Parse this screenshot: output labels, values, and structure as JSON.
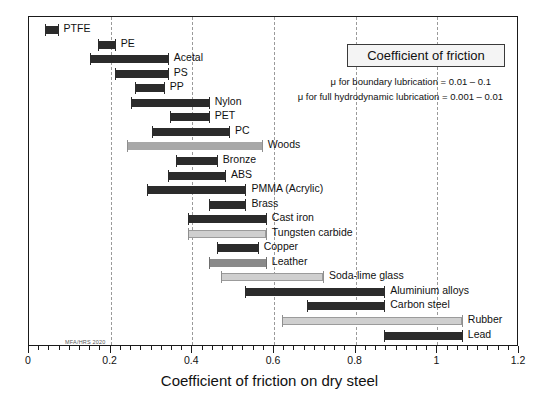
{
  "chart_data": {
    "type": "bar",
    "orientation": "horizontal",
    "style": "range-bar",
    "title": "Coefficient of friction",
    "xlabel": "Coefficient of friction on dry steel",
    "ylabel": "",
    "xlim": [
      0,
      1.2
    ],
    "xticks": [
      0,
      0.2,
      0.4,
      0.6,
      0.8,
      1,
      1.2
    ],
    "xticklabels": [
      "0",
      "0.2",
      "0.4",
      "0.6",
      "0.8",
      "1",
      "1.2"
    ],
    "minor_tick_step": 0.025,
    "gridlines": [
      0.2,
      0.4,
      0.6,
      0.8,
      1.0
    ],
    "grid": true,
    "legend": "none",
    "annotations": [
      "μ  for boundary lubrication = 0.01 – 0.1",
      "μ  for full hydrodynamic lubrication = 0.001 – 0.01"
    ],
    "watermark": "MFA/HRS 2020",
    "categories": [
      "PTFE",
      "PE",
      "Acetal",
      "PS",
      "PP",
      "Nylon",
      "PET",
      "PC",
      "Woods",
      "Bronze",
      "ABS",
      "PMMA (Acrylic)",
      "Brass",
      "Cast iron",
      "Tungsten carbide",
      "Copper",
      "Leather",
      "Soda-lime glass",
      "Aluminium alloys",
      "Carbon steel",
      "Rubber",
      "Lead"
    ],
    "bars": [
      {
        "label": "PTFE",
        "low": 0.04,
        "high": 0.07,
        "color": "#2b2b2b",
        "shade": "dark"
      },
      {
        "label": "PE",
        "low": 0.17,
        "high": 0.21,
        "color": "#2b2b2b",
        "shade": "dark"
      },
      {
        "label": "Acetal",
        "low": 0.15,
        "high": 0.34,
        "color": "#2b2b2b",
        "shade": "dark"
      },
      {
        "label": "PS",
        "low": 0.21,
        "high": 0.34,
        "color": "#2b2b2b",
        "shade": "dark"
      },
      {
        "label": "PP",
        "low": 0.26,
        "high": 0.33,
        "color": "#2b2b2b",
        "shade": "dark"
      },
      {
        "label": "Nylon",
        "low": 0.25,
        "high": 0.44,
        "color": "#2b2b2b",
        "shade": "dark"
      },
      {
        "label": "PET",
        "low": 0.345,
        "high": 0.44,
        "color": "#2b2b2b",
        "shade": "dark"
      },
      {
        "label": "PC",
        "low": 0.3,
        "high": 0.49,
        "color": "#2b2b2b",
        "shade": "dark"
      },
      {
        "label": "Woods",
        "low": 0.24,
        "high": 0.57,
        "color": "#a8a8a8",
        "shade": "gray-mid"
      },
      {
        "label": "Bronze",
        "low": 0.36,
        "high": 0.46,
        "color": "#2b2b2b",
        "shade": "dark"
      },
      {
        "label": "ABS",
        "low": 0.34,
        "high": 0.48,
        "color": "#2b2b2b",
        "shade": "dark"
      },
      {
        "label": "PMMA (Acrylic)",
        "low": 0.29,
        "high": 0.53,
        "color": "#2b2b2b",
        "shade": "dark"
      },
      {
        "label": "Brass",
        "low": 0.44,
        "high": 0.53,
        "color": "#2b2b2b",
        "shade": "dark"
      },
      {
        "label": "Cast iron",
        "low": 0.39,
        "high": 0.58,
        "color": "#2b2b2b",
        "shade": "dark"
      },
      {
        "label": "Tungsten carbide",
        "low": 0.39,
        "high": 0.58,
        "color": "#cfcfcf",
        "shade": "gray-light"
      },
      {
        "label": "Copper",
        "low": 0.46,
        "high": 0.56,
        "color": "#2b2b2b",
        "shade": "dark"
      },
      {
        "label": "Leather",
        "low": 0.44,
        "high": 0.58,
        "color": "#8a8a8a",
        "shade": "gray-dark"
      },
      {
        "label": "Soda-lime glass",
        "low": 0.47,
        "high": 0.72,
        "color": "#cfcfcf",
        "shade": "gray-light"
      },
      {
        "label": "Aluminium alloys",
        "low": 0.53,
        "high": 0.87,
        "color": "#2b2b2b",
        "shade": "dark"
      },
      {
        "label": "Carbon steel",
        "low": 0.68,
        "high": 0.87,
        "color": "#2b2b2b",
        "shade": "dark"
      },
      {
        "label": "Rubber",
        "low": 0.62,
        "high": 1.06,
        "color": "#cfcfcf",
        "shade": "gray-light"
      },
      {
        "label": "Lead",
        "low": 0.87,
        "high": 1.06,
        "color": "#2b2b2b",
        "shade": "dark"
      }
    ]
  },
  "colors": {
    "dark_bar": "#2b2b2b",
    "mid_gray_bar": "#a8a8a8",
    "light_gray_bar": "#cfcfcf",
    "dark_gray_bar": "#8a8a8a",
    "frame": "#1a1a1a",
    "grid": "#9a9a9a",
    "title_box_fill": "#f4f4f4"
  }
}
